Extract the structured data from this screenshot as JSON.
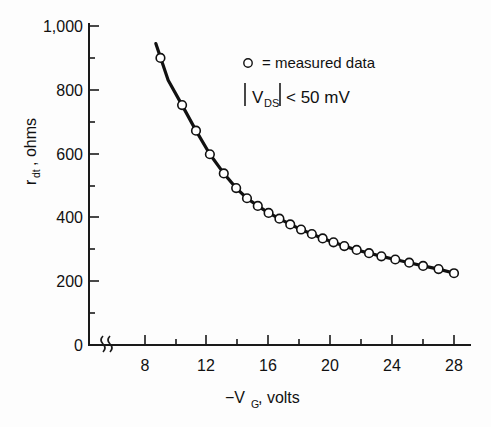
{
  "chart_data": {
    "type": "scatter",
    "title": "",
    "subtitle": "",
    "xlabel": "-V_G, volts",
    "xlabel_main": "−V",
    "xlabel_sub": "G",
    "xlabel_tail": ", volts",
    "ylabel": "r_dt, ohms",
    "ylabel_main": "r",
    "ylabel_sub": "dt",
    "ylabel_tail": ", ohms",
    "xlim": [
      6.2,
      29.5
    ],
    "ylim": [
      0,
      1000
    ],
    "x_ticks": [
      8,
      12,
      16,
      20,
      24,
      28
    ],
    "x_tick_labels": [
      "8",
      "12",
      "16",
      "20",
      "24",
      "28"
    ],
    "x_minor_ticks": [
      10,
      14,
      18,
      22,
      26
    ],
    "y_ticks": [
      0,
      200,
      400,
      600,
      800,
      1000
    ],
    "y_tick_labels": [
      "0",
      "200",
      "400",
      "600",
      "800",
      "1,000"
    ],
    "y_minor_ticks": [
      100,
      300,
      500,
      700,
      900
    ],
    "axis_break_x": true,
    "axis_break_label": "0",
    "grid": false,
    "legend_position": "upper-right",
    "legend": [
      {
        "marker": "open-circle",
        "text": "= measured data"
      },
      {
        "marker": "none",
        "text": "|V_DS| < 50 mV"
      }
    ],
    "legend_line1_marker": "○",
    "legend_line1_text": "= measured data",
    "legend_line2_prefix": "V",
    "legend_line2_sub": "DS",
    "legend_line2_tail": " < 50 mV",
    "series": [
      {
        "name": "measured data",
        "marker": "open-circle",
        "line": "solid",
        "x": [
          9.0,
          10.4,
          11.3,
          12.2,
          13.1,
          13.9,
          14.6,
          15.3,
          16.0,
          16.7,
          17.4,
          18.1,
          18.8,
          19.5,
          20.2,
          20.9,
          21.7,
          22.5,
          23.3,
          24.2,
          25.1,
          26.0,
          27.0,
          28.0
        ],
        "y": [
          900,
          752,
          672,
          598,
          538,
          492,
          460,
          436,
          414,
          396,
          378,
          362,
          348,
          334,
          322,
          310,
          298,
          288,
          278,
          268,
          258,
          248,
          238,
          225
        ]
      }
    ],
    "fit_curve": {
      "name": "smooth fit",
      "x": [
        8.7,
        9.5,
        10.4,
        11.3,
        12.2,
        13.1,
        13.9,
        14.6,
        15.3,
        16.0,
        16.7,
        17.4,
        18.1,
        18.8,
        19.5,
        20.2,
        20.9,
        21.7,
        22.5,
        23.3,
        24.2,
        25.1,
        26.0,
        27.0,
        28.1
      ],
      "y": [
        945,
        830,
        752,
        672,
        598,
        538,
        492,
        460,
        436,
        414,
        396,
        378,
        362,
        348,
        334,
        322,
        310,
        298,
        288,
        278,
        268,
        258,
        248,
        238,
        224
      ]
    }
  },
  "colors": {
    "ink": "#111111",
    "background": "#fdfdfd",
    "marker_fill": "#ffffff"
  }
}
